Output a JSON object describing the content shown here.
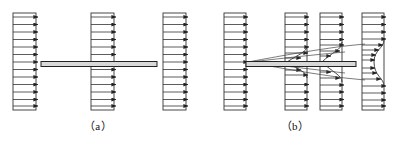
{
  "figure": {
    "type": "technical-diagram",
    "background_color": "#ffffff",
    "line_color": "#222222",
    "plate_fill_color": "#d8d8d8",
    "width": 393,
    "height": 142
  },
  "panels": [
    {
      "id": "panel-a",
      "caption": "（a）",
      "description": "ideal (inviscid) flow: uniform velocity profiles, no boundary layer",
      "origin_x": 0,
      "width": 196,
      "plate": {
        "x1": 41,
        "x2": 157,
        "y": 64,
        "thickness": 5
      },
      "profiles": [
        {
          "name": "profile-a-1",
          "station_x": 13,
          "box_left": 13,
          "box_right": 36,
          "box_top": 13,
          "box_bottom": 110,
          "arrow_count": 13,
          "shape": "uniform",
          "uniform_length": 23
        },
        {
          "name": "profile-a-2",
          "station_x": 91,
          "box_left": 91,
          "box_right": 114,
          "box_top": 13,
          "box_bottom": 110,
          "arrow_count": 13,
          "shape": "uniform",
          "uniform_length": 23
        },
        {
          "name": "profile-a-3",
          "station_x": 163,
          "box_left": 163,
          "box_right": 186,
          "box_top": 13,
          "box_bottom": 110,
          "arrow_count": 13,
          "shape": "uniform",
          "uniform_length": 23
        }
      ]
    },
    {
      "id": "panel-b",
      "caption": "（b）",
      "description": "real (viscous) flow: boundary layer grows along the plate and a velocity-deficit wake forms downstream",
      "origin_x": 197,
      "width": 196,
      "plate": {
        "x1": 246,
        "x2": 356,
        "y": 64,
        "thickness": 5
      },
      "profiles": [
        {
          "name": "profile-b-1",
          "station_x": 224,
          "box_left": 224,
          "box_right": 246,
          "box_top": 13,
          "box_bottom": 110,
          "arrow_count": 13,
          "shape": "uniform",
          "uniform_length": 22,
          "note": "upstream of leading edge, still uniform"
        },
        {
          "name": "profile-b-2",
          "station_x": 285,
          "box_left": 285,
          "box_right": 307,
          "box_top": 13,
          "box_bottom": 110,
          "arrow_count": 13,
          "shape": "boundary-layer",
          "uniform_length": 22,
          "layer_half_thickness": 11,
          "note": "thin boundary layer near plate"
        },
        {
          "name": "profile-b-3",
          "station_x": 320,
          "box_left": 320,
          "box_right": 342,
          "box_top": 13,
          "box_bottom": 110,
          "arrow_count": 13,
          "shape": "boundary-layer",
          "uniform_length": 22,
          "layer_half_thickness": 15,
          "note": "thicker boundary layer further downstream"
        },
        {
          "name": "profile-b-4",
          "station_x": 362,
          "box_left": 362,
          "box_right": 384,
          "box_top": 13,
          "box_bottom": 110,
          "arrow_count": 13,
          "shape": "wake",
          "uniform_length": 22,
          "wake_half_thickness": 20,
          "wake_min_length": 12,
          "note": "wake downstream of trailing edge, velocity deficit"
        }
      ],
      "boundary_layer_edges": {
        "description": "curved envelope lines spreading from the leading edge along the plate and into the wake",
        "count": 4
      }
    }
  ]
}
